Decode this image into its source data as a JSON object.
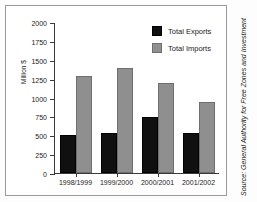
{
  "chart_data": {
    "type": "bar",
    "title": "",
    "xlabel": "",
    "ylabel": "Million $",
    "ylim": [
      0,
      2000
    ],
    "yticks": [
      0,
      250,
      500,
      750,
      1000,
      1250,
      1500,
      1750,
      2000
    ],
    "ytick_labels": [
      "0",
      "250",
      "500",
      "750",
      "1000",
      "1250",
      "1500",
      "1750",
      "2000"
    ],
    "grid": false,
    "legend_position": "top-right",
    "categories": [
      "1998/1999",
      "1999/2000",
      "2000/2001",
      "2001/2002"
    ],
    "series": [
      {
        "name": "Total Exports",
        "color": "#101010",
        "values": [
          510,
          525,
          740,
          530
        ]
      },
      {
        "name": "Total Imports",
        "color": "#8f8f8f",
        "values": [
          1290,
          1395,
          1190,
          940
        ]
      }
    ]
  },
  "legend": {
    "items": [
      {
        "label": "Total Exports"
      },
      {
        "label": "Total Imports"
      }
    ]
  },
  "source": {
    "note": "Source: General Authority for Free Zones and Investment"
  }
}
